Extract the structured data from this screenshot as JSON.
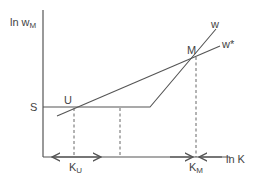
{
  "diagram": {
    "y_axis_label": "ln w",
    "y_axis_label_sub": "M",
    "x_axis_label": "ln K",
    "labels": {
      "S": "S",
      "U": "U",
      "M": "M",
      "w": "w",
      "w_star": "w*",
      "K_U": "K",
      "K_U_sub": "U",
      "K_M": "K",
      "K_M_sub": "M"
    },
    "colors": {
      "line": "#555555",
      "text": "#444444"
    }
  }
}
